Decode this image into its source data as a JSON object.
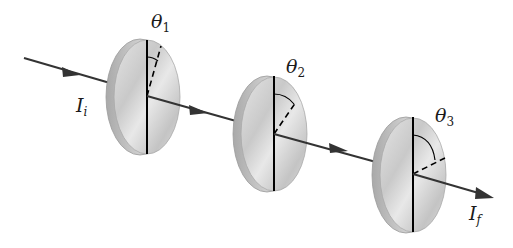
{
  "diagram": {
    "colors": {
      "background": "#ffffff",
      "ray": "#333333",
      "disk_face": "#d4d4d4",
      "disk_rim": "#b8b8b8",
      "axis": "#000000"
    },
    "input_label": {
      "symbol": "I",
      "subscript": "i"
    },
    "output_label": {
      "symbol": "I",
      "subscript": "f"
    },
    "polarizers": [
      {
        "id": 1,
        "angle_symbol": "θ",
        "angle_subscript": "1",
        "center": [
          146,
          96
        ]
      },
      {
        "id": 2,
        "angle_symbol": "θ",
        "angle_subscript": "2",
        "center": [
          274,
          133
        ]
      },
      {
        "id": 3,
        "angle_symbol": "θ",
        "angle_subscript": "3",
        "center": [
          413,
          174
        ]
      }
    ]
  }
}
